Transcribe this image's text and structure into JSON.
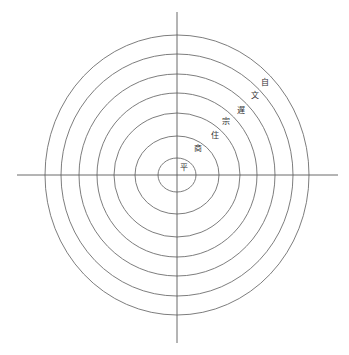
{
  "diagram": {
    "type": "concentric-circles",
    "center": [
      177,
      175
    ],
    "rings": [
      {
        "rx": 132,
        "ry": 140
      },
      {
        "rx": 116,
        "ry": 121
      },
      {
        "rx": 98,
        "ry": 101
      },
      {
        "rx": 80,
        "ry": 82
      },
      {
        "rx": 63,
        "ry": 62
      },
      {
        "rx": 42,
        "ry": 39
      },
      {
        "rx": 19,
        "ry": 17
      }
    ],
    "axes": {
      "horizontal": {
        "x1": 17,
        "x2": 338,
        "y": 175
      },
      "vertical": {
        "x": 177,
        "y1": 12,
        "y2": 343
      }
    },
    "labels": [
      {
        "text": "平",
        "x": 184,
        "y": 168
      },
      {
        "text": "商",
        "x": 198,
        "y": 149
      },
      {
        "text": "住",
        "x": 215,
        "y": 136
      },
      {
        "text": "宗",
        "x": 226,
        "y": 122
      },
      {
        "text": "遅",
        "x": 241,
        "y": 111
      },
      {
        "text": "文",
        "x": 255,
        "y": 96
      },
      {
        "text": "自",
        "x": 265,
        "y": 83
      }
    ],
    "colors": {
      "line": "#6e6e6e",
      "text": "#333333",
      "background": "#ffffff"
    }
  }
}
